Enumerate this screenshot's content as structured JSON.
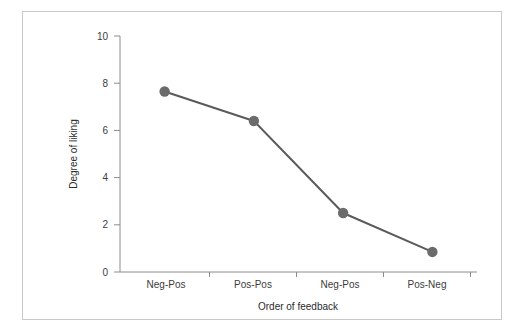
{
  "figure": {
    "background_color": "#ffffff",
    "frame_border_color": "#c9c9c9",
    "axis_color": "#8c8c8c"
  },
  "chart_data": {
    "type": "line",
    "title": "",
    "subtitle": "",
    "xlabel": "Order of feedback",
    "ylabel": "Degree of liking",
    "categories": [
      "Neg-Pos",
      "Pos-Pos",
      "Neg-Pos",
      "Pos-Neg"
    ],
    "values": [
      7.65,
      6.4,
      2.5,
      0.85
    ],
    "series": [
      {
        "name": "Degree of liking",
        "values": [
          7.65,
          6.4,
          2.5,
          0.85
        ],
        "line_color": "#5a5a5a",
        "marker_color": "#6b6b6b",
        "marker": "circle"
      }
    ],
    "ylim": [
      0,
      10
    ],
    "yticks": [
      0,
      2,
      4,
      6,
      8,
      10
    ],
    "ytick_labels": [
      "0",
      "2",
      "4",
      "6",
      "8",
      "10"
    ],
    "xtick_labels": [
      "Neg-Pos",
      "Pos-Pos",
      "Neg-Pos",
      "Pos-Neg"
    ],
    "grid": false,
    "legend": false,
    "legend_position": "none"
  }
}
